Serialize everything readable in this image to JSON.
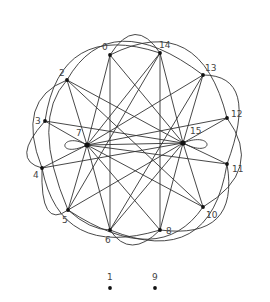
{
  "diagram": {
    "type": "directed-graph",
    "nodes": [
      {
        "id": "0",
        "label": "0",
        "x": 110,
        "y": 55,
        "lx": 102,
        "ly": 50
      },
      {
        "id": "14",
        "label": "14",
        "x": 160,
        "y": 53,
        "lx": 159,
        "ly": 48
      },
      {
        "id": "13",
        "label": "13",
        "x": 203,
        "y": 75,
        "lx": 205,
        "ly": 71
      },
      {
        "id": "2",
        "label": "2",
        "x": 67,
        "y": 80,
        "lx": 59,
        "ly": 76
      },
      {
        "id": "12",
        "label": "12",
        "x": 227,
        "y": 118,
        "lx": 231,
        "ly": 117
      },
      {
        "id": "3",
        "label": "3",
        "x": 45,
        "y": 121,
        "lx": 35,
        "ly": 124
      },
      {
        "id": "7",
        "label": "7",
        "x": 87,
        "y": 145,
        "lx": 76,
        "ly": 136
      },
      {
        "id": "15",
        "label": "15",
        "x": 183,
        "y": 143,
        "lx": 190,
        "ly": 134
      },
      {
        "id": "11",
        "label": "11",
        "x": 227,
        "y": 164,
        "lx": 232,
        "ly": 172
      },
      {
        "id": "4",
        "label": "4",
        "x": 42,
        "y": 168,
        "lx": 33,
        "ly": 178
      },
      {
        "id": "10",
        "label": "10",
        "x": 203,
        "y": 207,
        "lx": 206,
        "ly": 218
      },
      {
        "id": "5",
        "label": "5",
        "x": 68,
        "y": 210,
        "lx": 62,
        "ly": 223
      },
      {
        "id": "8",
        "label": "8",
        "x": 160,
        "y": 230,
        "lx": 166,
        "ly": 234
      },
      {
        "id": "6",
        "label": "6",
        "x": 110,
        "y": 230,
        "lx": 105,
        "ly": 243
      },
      {
        "id": "1",
        "label": "1",
        "x": 110,
        "y": 288,
        "lx": 107,
        "ly": 280
      },
      {
        "id": "9",
        "label": "9",
        "x": 155,
        "y": 288,
        "lx": 152,
        "ly": 280
      }
    ],
    "hubs": [
      "7",
      "15"
    ],
    "isolated_nodes": [
      "1",
      "9"
    ],
    "self_loops": [
      "7",
      "15"
    ]
  }
}
